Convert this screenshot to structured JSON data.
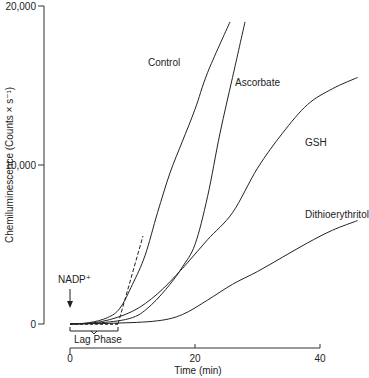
{
  "chart_data": {
    "type": "line",
    "title": "",
    "xlabel": "Time (min)",
    "ylabel": "Chemiluminescence (Counts × s⁻¹)",
    "xlim": [
      0,
      47
    ],
    "ylim": [
      0,
      20000
    ],
    "x_ticks": [
      0,
      20,
      40
    ],
    "x_tick_labels": [
      "0",
      "20",
      "40"
    ],
    "y_ticks": [
      0,
      10000,
      20000
    ],
    "y_tick_labels": [
      "0",
      "10,000",
      "20,000"
    ],
    "grid": false,
    "legend": "inline labels",
    "series": [
      {
        "name": "Control",
        "points": [
          [
            0,
            0
          ],
          [
            3,
            80
          ],
          [
            6,
            400
          ],
          [
            8,
            1000
          ],
          [
            10,
            2500
          ],
          [
            12,
            4300
          ],
          [
            14,
            7000
          ],
          [
            16,
            9500
          ],
          [
            18,
            11500
          ],
          [
            20,
            13500
          ],
          [
            22,
            15800
          ],
          [
            25.6,
            19000
          ]
        ]
      },
      {
        "name": "Ascorbate",
        "points": [
          [
            0,
            0
          ],
          [
            5,
            80
          ],
          [
            10,
            400
          ],
          [
            13,
            1200
          ],
          [
            16,
            2500
          ],
          [
            18,
            3600
          ],
          [
            20,
            5000
          ],
          [
            22,
            8000
          ],
          [
            24,
            12000
          ],
          [
            26,
            15500
          ],
          [
            28,
            19000
          ]
        ]
      },
      {
        "name": "GSH",
        "points": [
          [
            0,
            0
          ],
          [
            5,
            150
          ],
          [
            10,
            800
          ],
          [
            14,
            1900
          ],
          [
            18,
            3500
          ],
          [
            22,
            5300
          ],
          [
            26,
            7000
          ],
          [
            30,
            9800
          ],
          [
            34,
            12000
          ],
          [
            38,
            13800
          ],
          [
            42,
            14800
          ],
          [
            46,
            15500
          ]
        ]
      },
      {
        "name": "Dithioerythritol",
        "points": [
          [
            0,
            0
          ],
          [
            7,
            50
          ],
          [
            14,
            200
          ],
          [
            18,
            600
          ],
          [
            22,
            1500
          ],
          [
            26,
            2500
          ],
          [
            30,
            3300
          ],
          [
            34,
            4200
          ],
          [
            38,
            5100
          ],
          [
            42,
            5900
          ],
          [
            46,
            6500
          ]
        ]
      }
    ],
    "annotations": [
      {
        "text": "NADP⁺",
        "x": 0,
        "type": "arrow-down",
        "meaning": "NADP+ added at t=0"
      },
      {
        "text": "Lag Phase",
        "x_range": [
          0,
          7.7
        ],
        "type": "bracket"
      },
      {
        "text": "",
        "type": "dashed-tangent",
        "from": [
          7.7,
          0
        ],
        "to": [
          12,
          4300
        ],
        "meaning": "extrapolation of Control slope to baseline"
      }
    ]
  },
  "labels": {
    "control": "Control",
    "ascorbate": "Ascorbate",
    "gsh": "GSH",
    "dte": "Dithioerythritol",
    "nadp": "NADP⁺",
    "lag": "Lag Phase",
    "xlabel": "Time (min)",
    "ylabel": "Chemiluminescence (Counts × s⁻¹)",
    "y0": "0",
    "y1": "10,000",
    "y2": "20,000",
    "x0": "0",
    "x1": "20",
    "x2": "40"
  }
}
